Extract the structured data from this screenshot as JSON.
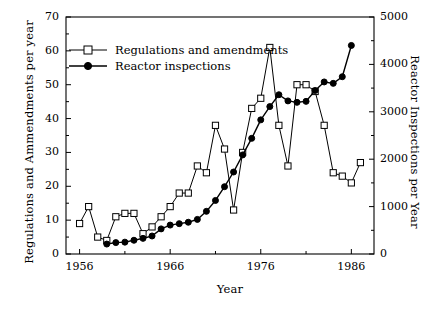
{
  "chart_data": {
    "type": "line",
    "title": "",
    "xlabel": "Year",
    "ylabel": "Regulations and Ammendments per year",
    "ylabel_right": "Reactor Inspections per Year",
    "xlim": [
      1954.5,
      1988.5
    ],
    "ylim": [
      0,
      70
    ],
    "ylim_right": [
      0,
      5000
    ],
    "xticks": [
      1956,
      1966,
      1976,
      1986
    ],
    "xtick_labels": [
      "1956",
      "1966",
      "1976",
      "1986"
    ],
    "xminor_step": 5,
    "yticks": [
      0,
      10,
      20,
      30,
      40,
      50,
      60,
      70
    ],
    "ytick_labels": [
      "0",
      "10",
      "20",
      "30",
      "40",
      "50",
      "60",
      "70"
    ],
    "yminor_step": 5,
    "yticks_right": [
      0,
      1000,
      2000,
      3000,
      4000,
      5000
    ],
    "ytick_labels_right": [
      "0",
      "1000",
      "2000",
      "3000",
      "4000",
      "5000"
    ],
    "yminor_step_right": 500,
    "grid": false,
    "legend_position": "upper left",
    "series": [
      {
        "name": "Regulations and amendments",
        "marker": "open-square",
        "axis": "left",
        "color": "#000000",
        "x": [
          1956,
          1957,
          1958,
          1959,
          1960,
          1961,
          1962,
          1963,
          1964,
          1965,
          1966,
          1967,
          1968,
          1969,
          1970,
          1971,
          1972,
          1973,
          1974,
          1975,
          1976,
          1977,
          1978,
          1979,
          1980,
          1981,
          1982,
          1983,
          1984,
          1985,
          1986,
          1987
        ],
        "y": [
          9,
          14,
          5,
          4,
          11,
          12,
          12,
          6,
          8,
          11,
          14,
          18,
          18,
          26,
          24,
          38,
          31,
          13,
          30,
          43,
          46,
          61,
          38,
          26,
          50,
          50,
          48,
          38,
          24,
          23,
          21,
          27
        ]
      },
      {
        "name": "Reactor inspections",
        "marker": "filled-circle",
        "axis": "right",
        "color": "#000000",
        "x": [
          1959,
          1960,
          1961,
          1962,
          1963,
          1964,
          1965,
          1966,
          1967,
          1968,
          1969,
          1970,
          1971,
          1972,
          1973,
          1974,
          1975,
          1976,
          1977,
          1978,
          1979,
          1980,
          1981,
          1982,
          1983,
          1984,
          1985,
          1986
        ],
        "y": [
          210,
          240,
          250,
          290,
          330,
          380,
          530,
          610,
          640,
          670,
          730,
          900,
          1130,
          1420,
          1730,
          2090,
          2440,
          2830,
          3110,
          3360,
          3230,
          3200,
          3220,
          3450,
          3630,
          3600,
          3740,
          4400
        ],
        "y_right_display": [
          210,
          240,
          250,
          290,
          330,
          380,
          530,
          610,
          640,
          670,
          730,
          900,
          1130,
          1420,
          1730,
          2090,
          2440,
          2830,
          3110,
          3360,
          3230,
          3200,
          3220,
          3450,
          3630,
          3600,
          3740,
          4400
        ]
      }
    ],
    "legend": [
      {
        "label": "Regulations and amendments",
        "marker": "open-square"
      },
      {
        "label": "Reactor inspections",
        "marker": "filled-circle"
      }
    ]
  },
  "colors": {
    "axis": "#000000",
    "line": "#000000",
    "background": "#ffffff"
  }
}
